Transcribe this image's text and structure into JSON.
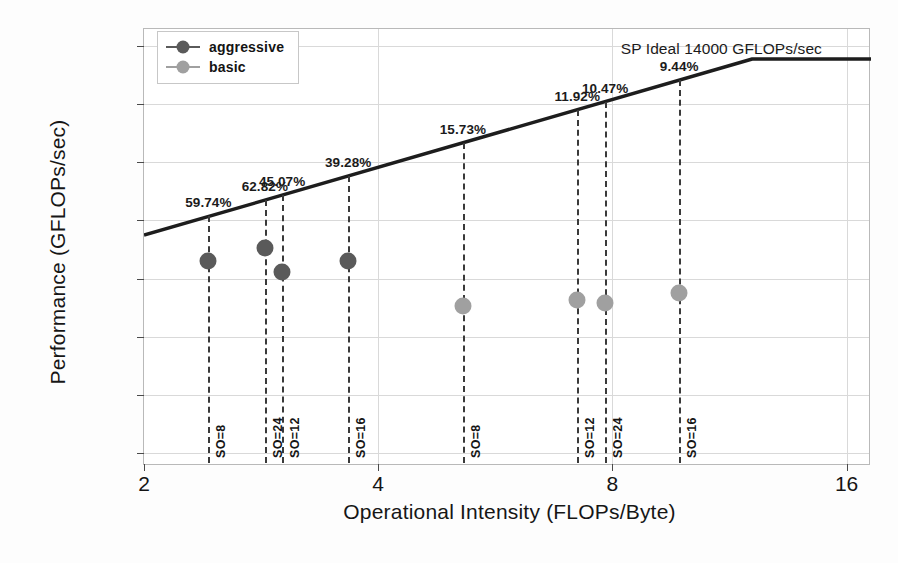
{
  "chart_data": {
    "type": "scatter",
    "title": "",
    "xlabel": "Operational Intensity (FLOPs/Byte)",
    "ylabel": "Performance (GFLOPs/sec)",
    "xscale": "log2",
    "yscale": "log2",
    "xlim": [
      2,
      17.2
    ],
    "ylim": [
      110,
      20000
    ],
    "xticks": [
      2,
      4,
      8,
      16
    ],
    "xtick_labels": [
      "2",
      "4",
      "8",
      "16"
    ],
    "yticks": [
      128,
      256,
      512,
      1024,
      2048,
      4096,
      8192,
      16384
    ],
    "ytick_labels": [
      "128",
      "256",
      "512",
      "1024",
      "2048",
      "4096",
      "8192",
      "16384"
    ],
    "grid": true,
    "legend_position": "upper left",
    "annotations": [
      {
        "text": "SP Ideal 14000 GFLOPs/sec",
        "x": 8.2,
        "y": 16000
      }
    ],
    "roofline": {
      "label": "SP Ideal 14000 GFLOPs/sec",
      "peak_gflops": 14000,
      "knee_x": 12.1,
      "start": {
        "x": 2,
        "y": 1720
      },
      "end": {
        "x": 17.2,
        "y": 14000
      }
    },
    "series": [
      {
        "name": "aggressive",
        "color": "#5a5a5a",
        "points": [
          {
            "x": 2.42,
            "y": 1260,
            "pct": "59.74%",
            "so": "SO=8"
          },
          {
            "x": 2.86,
            "y": 1480,
            "pct": "62.82%",
            "so": "SO=24"
          },
          {
            "x": 3.01,
            "y": 1110,
            "pct": "45.07%",
            "so": "SO=12"
          },
          {
            "x": 3.66,
            "y": 1260,
            "pct": "39.28%",
            "so": "SO=16"
          }
        ]
      },
      {
        "name": "basic",
        "color": "#a0a0a0",
        "points": [
          {
            "x": 5.14,
            "y": 735,
            "pct": "15.73%",
            "so": "SO=8"
          },
          {
            "x": 7.21,
            "y": 790,
            "pct": "11.92%",
            "so": "SO=12"
          },
          {
            "x": 7.83,
            "y": 765,
            "pct": "10.47%",
            "so": "SO=24"
          },
          {
            "x": 9.75,
            "y": 860,
            "pct": "9.44%",
            "so": "SO=16"
          }
        ]
      }
    ]
  },
  "legend": {
    "items": [
      {
        "label": "aggressive",
        "color": "#5a5a5a"
      },
      {
        "label": "basic",
        "color": "#a0a0a0"
      }
    ]
  },
  "axes": {
    "x_title": "Operational Intensity (FLOPs/Byte)",
    "y_title": "Performance (GFLOPs/sec)"
  }
}
